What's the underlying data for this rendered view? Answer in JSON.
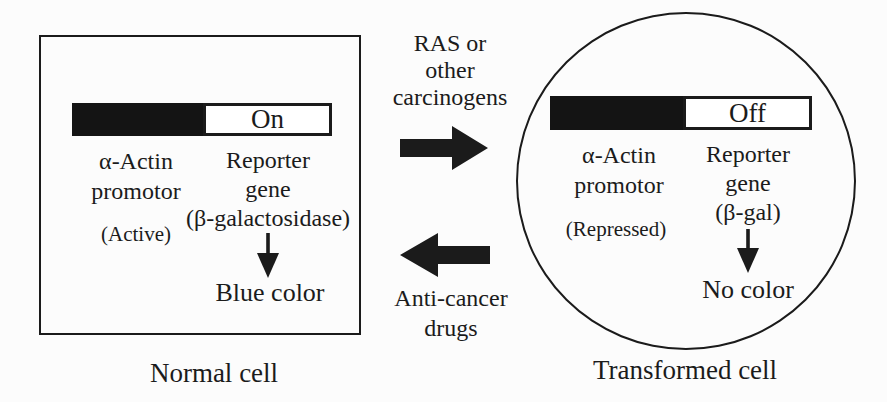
{
  "colors": {
    "ink": "#1b1b1b",
    "bar_fill": "#141414",
    "bar_empty": "#ffffff",
    "background": "#fcfcfc"
  },
  "normal_cell": {
    "bar_state": "On",
    "promoter_line1": "α-Actin",
    "promoter_line2": "promotor",
    "promoter_status": "(Active)",
    "reporter_line1": "Reporter",
    "reporter_line2": "gene",
    "reporter_line3": "(β-galactosidase)",
    "result": "Blue color",
    "caption": "Normal cell"
  },
  "transformed_cell": {
    "bar_state": "Off",
    "promoter_line1": "α-Actin",
    "promoter_line2": "promotor",
    "promoter_status": "(Repressed)",
    "reporter_line1": "Reporter",
    "reporter_line2": "gene",
    "reporter_line3": "(β-gal)",
    "result": "No color",
    "caption": "Transformed cell"
  },
  "forward_transition": {
    "line1": "RAS or",
    "line2": "other",
    "line3": "carcinogens"
  },
  "reverse_transition": {
    "line1": "Anti-cancer",
    "line2": "drugs"
  }
}
